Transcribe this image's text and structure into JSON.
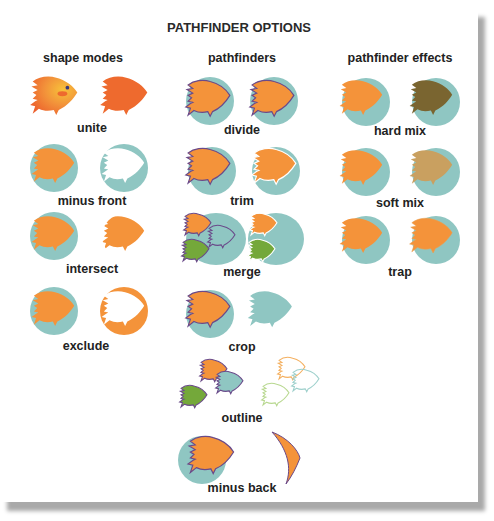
{
  "title": "PATHFINDER OPTIONS",
  "colors": {
    "orange": "#f4933a",
    "orange_red": "#ee6a2e",
    "teal": "#8fc6c2",
    "green": "#74a83a",
    "purple_outline": "#6a4a8a",
    "hard_mix_brown": "#7a6530",
    "soft_mix_tan": "#c9a060",
    "shadow": "#a9a9a9"
  },
  "columns": [
    {
      "heading": "shape modes",
      "items": [
        {
          "label": "unite",
          "icon": "fish-unite-icon"
        },
        {
          "label": "minus front",
          "icon": "fish-minus-front-icon"
        },
        {
          "label": "intersect",
          "icon": "fish-intersect-icon"
        },
        {
          "label": "exclude",
          "icon": "fish-exclude-icon"
        }
      ]
    },
    {
      "heading": "pathfinders",
      "items": [
        {
          "label": "divide",
          "icon": "fish-divide-icon"
        },
        {
          "label": "trim",
          "icon": "fish-trim-icon"
        },
        {
          "label": "merge",
          "icon": "fish-merge-icon"
        },
        {
          "label": "crop",
          "icon": "fish-crop-icon"
        },
        {
          "label": "outline",
          "icon": "fish-outline-icon"
        },
        {
          "label": "minus back",
          "icon": "fish-minus-back-icon"
        }
      ]
    },
    {
      "heading": "pathfinder effects",
      "items": [
        {
          "label": "hard mix",
          "icon": "fish-hard-mix-icon"
        },
        {
          "label": "soft mix",
          "icon": "fish-soft-mix-icon"
        },
        {
          "label": "trap",
          "icon": "fish-trap-icon"
        }
      ]
    }
  ]
}
